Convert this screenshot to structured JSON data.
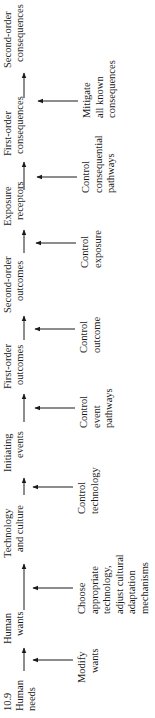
{
  "figure": {
    "number": "10.9",
    "orientation": "rotated 90 degrees counter-clockwise"
  },
  "chain": [
    {
      "id": "human-needs",
      "line1": "Human",
      "line2": "needs"
    },
    {
      "id": "human-wants",
      "line1": "Human",
      "line2": "wants"
    },
    {
      "id": "technology-and-culture",
      "line1": "Technology",
      "line2": "and culture"
    },
    {
      "id": "initiating-events",
      "line1": "Initiating",
      "line2": "events"
    },
    {
      "id": "first-order-outcomes",
      "line1": "First-order",
      "line2": "outcomes"
    },
    {
      "id": "second-order-outcomes",
      "line1": "Second-order",
      "line2": "outcomes"
    },
    {
      "id": "exposure-receptors",
      "line1": "Exposure",
      "line2": "receptors"
    },
    {
      "id": "first-order-consequences",
      "line1": "First-order",
      "line2": "consequences"
    },
    {
      "id": "second-order-consequences",
      "line1": "Second-order",
      "line2": "consequences"
    }
  ],
  "controls": [
    {
      "id": "modify-wants",
      "lines": [
        "Modify",
        "wants"
      ]
    },
    {
      "id": "choose-technology",
      "lines": [
        "Choose",
        "appropriate",
        "technology,",
        "adjust cultural",
        "adaptation",
        "mechanisms"
      ]
    },
    {
      "id": "control-technology",
      "lines": [
        "Control",
        "technology"
      ]
    },
    {
      "id": "control-event-pathways",
      "lines": [
        "Control",
        "event",
        "pathways"
      ]
    },
    {
      "id": "control-outcome",
      "lines": [
        "Control",
        "outcome"
      ]
    },
    {
      "id": "control-exposure",
      "lines": [
        "Control",
        "exposure"
      ]
    },
    {
      "id": "control-consequential-pathways",
      "lines": [
        "Control",
        "consequential",
        "pathways"
      ]
    },
    {
      "id": "mitigate-consequences",
      "lines": [
        "Mitigate",
        "all known",
        "consequences"
      ]
    }
  ]
}
